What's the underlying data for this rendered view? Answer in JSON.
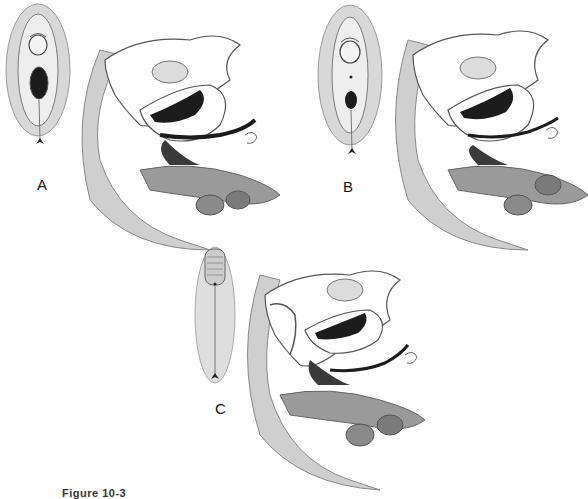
{
  "figure": {
    "caption": "Figure 10-3",
    "panels": [
      {
        "id": "A",
        "label": "A",
        "perineal_view": "external perineum with visible vaginal opening and anus",
        "sagittal_view": "midsagittal pelvic section"
      },
      {
        "id": "B",
        "label": "B",
        "perineal_view": "external perineum with smaller vaginal opening",
        "sagittal_view": "midsagittal pelvic section"
      },
      {
        "id": "C",
        "label": "C",
        "perineal_view": "external perineum with fused labia / phallic structure",
        "sagittal_view": "midsagittal pelvic section with urogenital sinus"
      }
    ]
  },
  "colors": {
    "background": "#ffffff",
    "tissue_light": "#e6e6e6",
    "tissue_mid": "#b8b8b8",
    "tissue_dark": "#6e6e6e",
    "lumen": "#1c1c1c",
    "outline": "#4a4a4a"
  }
}
